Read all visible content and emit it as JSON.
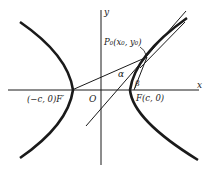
{
  "diagram": {
    "type": "hyperbola-focal-property",
    "axes": {
      "x_label": "x",
      "y_label": "y",
      "origin_label": "O"
    },
    "points": {
      "P0": {
        "label": "P₀(x₀, y₀)"
      },
      "F_left": {
        "label": "(−c, 0)F′"
      },
      "F_right": {
        "label": "F(c, 0)"
      }
    },
    "angles": {
      "alpha": "α",
      "beta": "β"
    },
    "colors": {
      "stroke": "#1a1a1a",
      "background": "#ffffff"
    }
  }
}
